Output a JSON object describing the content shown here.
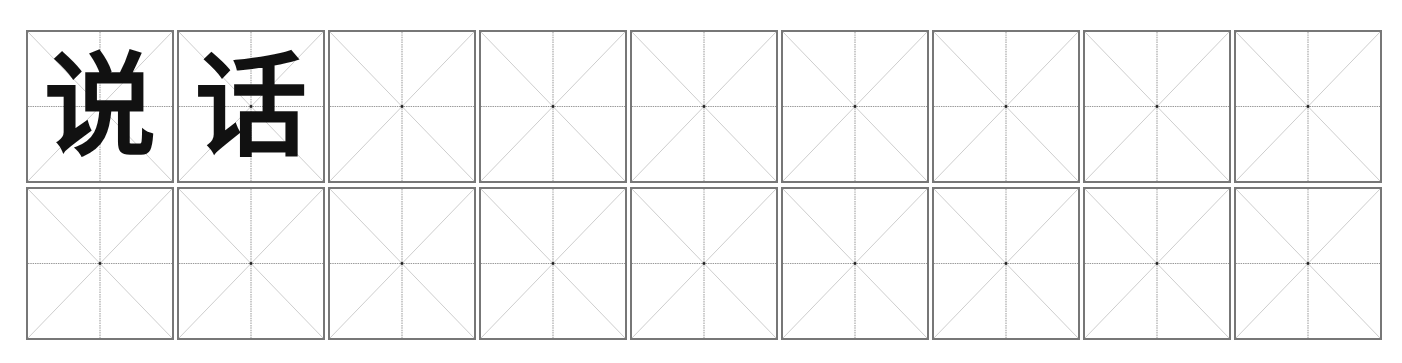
{
  "worksheet": {
    "columns": 9,
    "rows": 2,
    "grid_type": "米字格",
    "cells": [
      {
        "char": "说"
      },
      {
        "char": "话"
      },
      {
        "char": ""
      },
      {
        "char": ""
      },
      {
        "char": ""
      },
      {
        "char": ""
      },
      {
        "char": ""
      },
      {
        "char": ""
      },
      {
        "char": ""
      },
      {
        "char": ""
      },
      {
        "char": ""
      },
      {
        "char": ""
      },
      {
        "char": ""
      },
      {
        "char": ""
      },
      {
        "char": ""
      },
      {
        "char": ""
      },
      {
        "char": ""
      },
      {
        "char": ""
      }
    ]
  }
}
